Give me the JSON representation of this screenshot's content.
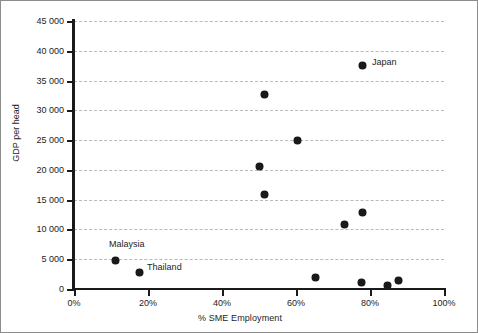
{
  "chart_data": {
    "type": "scatter",
    "title": "",
    "xlabel": "% SME Employment",
    "ylabel": "GDP per head",
    "xlim": [
      0,
      100
    ],
    "ylim": [
      0,
      45000
    ],
    "grid": true,
    "grid_axis": "y",
    "legend": "none",
    "x_ticks": [
      "0%",
      "20%",
      "40%",
      "60%",
      "80%",
      "100%"
    ],
    "x_tick_values": [
      0,
      20,
      40,
      60,
      80,
      100
    ],
    "y_ticks": [
      "0",
      "5 000",
      "10 000",
      "15 000",
      "20 000",
      "25 000",
      "30 000",
      "35 000",
      "40 000",
      "45 000"
    ],
    "y_tick_values": [
      0,
      5000,
      10000,
      15000,
      20000,
      25000,
      30000,
      35000,
      40000,
      45000
    ],
    "marker_color": "#1a1a1a",
    "points": [
      {
        "x": 11.1,
        "y": 4800,
        "label": "Malaysia",
        "label_dx": -6,
        "label_dy": -16
      },
      {
        "x": 17.6,
        "y": 2800,
        "label": "Thailand",
        "label_dx": 8,
        "label_dy": -5
      },
      {
        "x": 50.0,
        "y": 20650,
        "label": "",
        "label_dx": 0,
        "label_dy": 0
      },
      {
        "x": 51.4,
        "y": 15950,
        "label": "",
        "label_dx": 0,
        "label_dy": 0
      },
      {
        "x": 51.6,
        "y": 32700,
        "label": "",
        "label_dx": 0,
        "label_dy": 0
      },
      {
        "x": 60.5,
        "y": 25000,
        "label": "",
        "label_dx": 0,
        "label_dy": 0
      },
      {
        "x": 65.4,
        "y": 1850,
        "label": "",
        "label_dx": 0,
        "label_dy": 0
      },
      {
        "x": 73.2,
        "y": 10750,
        "label": "",
        "label_dx": 0,
        "label_dy": 0
      },
      {
        "x": 77.6,
        "y": 1175,
        "label": "",
        "label_dx": 0,
        "label_dy": 0
      },
      {
        "x": 78.1,
        "y": 12900,
        "label": "",
        "label_dx": 0,
        "label_dy": 0
      },
      {
        "x": 78.1,
        "y": 37600,
        "label": "Japan",
        "label_dx": 9,
        "label_dy": -3
      },
      {
        "x": 84.6,
        "y": 670,
        "label": "",
        "label_dx": 0,
        "label_dy": 0
      },
      {
        "x": 87.6,
        "y": 1510,
        "label": "",
        "label_dx": 0,
        "label_dy": 0
      }
    ]
  }
}
